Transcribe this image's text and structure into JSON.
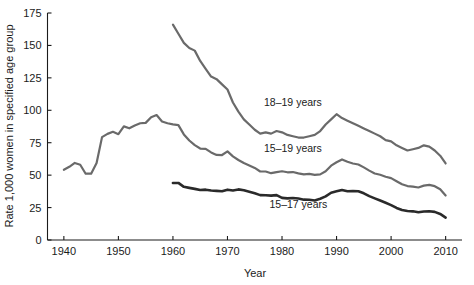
{
  "chart_data": {
    "type": "line",
    "title": "",
    "xlabel": "Year",
    "ylabel": "Rate 1,000 women in specified age group",
    "xlim": [
      1937,
      2013
    ],
    "ylim": [
      0,
      175
    ],
    "xticks": [
      1940,
      1950,
      1960,
      1970,
      1980,
      1990,
      2000,
      2010
    ],
    "xtick_labels": [
      "1940",
      "1950",
      "1960",
      "1970",
      "1980",
      "1990",
      "2000",
      "2010"
    ],
    "yticks": [
      0,
      25,
      50,
      75,
      100,
      125,
      150,
      175
    ],
    "ytick_labels": [
      "0",
      "25",
      "50",
      "75",
      "100",
      "125",
      "150",
      "175"
    ],
    "grid": false,
    "legend_position": "inline-annotations",
    "series": [
      {
        "name": "18-19 years",
        "label": "18–19 years",
        "color": "#6a6a6a",
        "label_x": 1982,
        "label_y": 103,
        "x": [
          1960,
          1961,
          1962,
          1963,
          1964,
          1965,
          1966,
          1967,
          1968,
          1969,
          1970,
          1971,
          1972,
          1973,
          1974,
          1975,
          1976,
          1977,
          1978,
          1979,
          1980,
          1981,
          1982,
          1983,
          1984,
          1985,
          1986,
          1987,
          1988,
          1989,
          1990,
          1991,
          1992,
          1993,
          1994,
          1995,
          1996,
          1997,
          1998,
          1999,
          2000,
          2001,
          2002,
          2003,
          2004,
          2005,
          2006,
          2007,
          2008,
          2009,
          2010
        ],
        "values": [
          166.0,
          159.0,
          152.0,
          148.0,
          146.0,
          138.0,
          132.0,
          126.0,
          124.0,
          120.0,
          116.0,
          106.0,
          99.0,
          93.0,
          89.0,
          85.0,
          82.0,
          83.0,
          82.0,
          84.0,
          83.0,
          81.0,
          80.0,
          79.0,
          79.0,
          80.0,
          81.0,
          84.0,
          89.0,
          93.0,
          97.0,
          94.0,
          92.0,
          90.0,
          88.0,
          86.0,
          84.0,
          82.0,
          80.0,
          77.0,
          76.0,
          73.0,
          71.0,
          69.0,
          70.0,
          71.0,
          73.0,
          72.0,
          69.0,
          65.0,
          59.0
        ]
      },
      {
        "name": "15-19 years",
        "label": "15–19 years",
        "color": "#6a6a6a",
        "label_x": 1982,
        "label_y": 68,
        "x": [
          1940,
          1941,
          1942,
          1943,
          1944,
          1945,
          1946,
          1947,
          1948,
          1949,
          1950,
          1951,
          1952,
          1953,
          1954,
          1955,
          1956,
          1957,
          1958,
          1959,
          1960,
          1961,
          1962,
          1963,
          1964,
          1965,
          1966,
          1967,
          1968,
          1969,
          1970,
          1971,
          1972,
          1973,
          1974,
          1975,
          1976,
          1977,
          1978,
          1979,
          1980,
          1981,
          1982,
          1983,
          1984,
          1985,
          1986,
          1987,
          1988,
          1989,
          1990,
          1991,
          1992,
          1993,
          1994,
          1995,
          1996,
          1997,
          1998,
          1999,
          2000,
          2001,
          2002,
          2003,
          2004,
          2005,
          2006,
          2007,
          2008,
          2009,
          2010
        ],
        "values": [
          54.1,
          56.4,
          59.4,
          58.0,
          51.1,
          51.1,
          59.3,
          79.3,
          81.8,
          83.4,
          81.6,
          87.6,
          86.1,
          88.2,
          90.0,
          90.3,
          94.7,
          96.3,
          91.4,
          90.0,
          89.1,
          88.6,
          81.4,
          76.7,
          73.1,
          70.5,
          70.3,
          67.5,
          65.6,
          65.5,
          68.3,
          64.5,
          61.7,
          59.3,
          57.5,
          55.6,
          52.8,
          52.8,
          51.5,
          52.3,
          53.0,
          52.2,
          52.4,
          51.4,
          50.6,
          51.0,
          50.2,
          50.6,
          53.0,
          57.3,
          59.9,
          62.1,
          60.3,
          59.0,
          58.2,
          56.0,
          53.5,
          51.3,
          50.3,
          48.8,
          47.7,
          45.3,
          43.0,
          41.6,
          41.1,
          40.5,
          41.9,
          42.5,
          41.5,
          39.1,
          34.3
        ]
      },
      {
        "name": "15-17 years",
        "label": "15–17 years",
        "color": "#2a2a2a",
        "label_x": 1983,
        "label_y": 25,
        "x": [
          1960,
          1961,
          1962,
          1963,
          1964,
          1965,
          1966,
          1967,
          1968,
          1969,
          1970,
          1971,
          1972,
          1973,
          1974,
          1975,
          1976,
          1977,
          1978,
          1979,
          1980,
          1981,
          1982,
          1983,
          1984,
          1985,
          1986,
          1987,
          1988,
          1989,
          1990,
          1991,
          1992,
          1993,
          1994,
          1995,
          1996,
          1997,
          1998,
          1999,
          2000,
          2001,
          2002,
          2003,
          2004,
          2005,
          2006,
          2007,
          2008,
          2009,
          2010
        ],
        "values": [
          43.9,
          44.0,
          41.0,
          40.2,
          39.4,
          38.5,
          38.8,
          38.2,
          37.9,
          37.6,
          38.8,
          38.2,
          39.0,
          38.4,
          37.2,
          36.0,
          34.6,
          34.5,
          34.2,
          34.6,
          32.5,
          32.1,
          32.4,
          32.0,
          31.1,
          31.0,
          30.5,
          31.8,
          33.6,
          36.4,
          37.5,
          38.6,
          37.6,
          37.8,
          37.6,
          36.0,
          33.8,
          32.1,
          30.4,
          28.7,
          26.9,
          24.7,
          23.2,
          22.4,
          22.1,
          21.4,
          22.0,
          22.1,
          21.7,
          20.1,
          17.3
        ]
      }
    ]
  },
  "axis": {
    "x_title": "Year",
    "y_title": "Rate 1,000 women in specified age group"
  }
}
